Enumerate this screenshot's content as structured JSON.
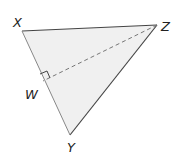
{
  "diagram": {
    "type": "geometry-triangle",
    "fill_color": "#f0f0f0",
    "edge_color": "#444444",
    "vertices": {
      "X": {
        "label": "X",
        "x": 22,
        "y": 31
      },
      "Z": {
        "label": "Z",
        "x": 157,
        "y": 25
      },
      "Y": {
        "label": "Y",
        "x": 70,
        "y": 135
      },
      "W": {
        "label": "W",
        "x": 43,
        "y": 81
      }
    },
    "segments": [
      {
        "from": "X",
        "to": "Z",
        "style": "solid"
      },
      {
        "from": "Z",
        "to": "Y",
        "style": "solid"
      },
      {
        "from": "X",
        "to": "Y",
        "style": "solid"
      },
      {
        "from": "Z",
        "to": "W",
        "style": "dashed"
      }
    ],
    "right_angle_marker": {
      "at": "W",
      "between": [
        "X",
        "Z"
      ]
    }
  }
}
